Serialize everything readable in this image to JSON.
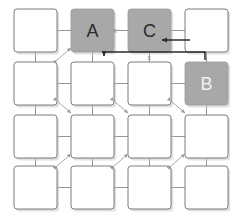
{
  "diagram": {
    "canvas": {
      "width": 237,
      "height": 218
    },
    "colors": {
      "background": "#ffffff",
      "node_fill": "#ffffff",
      "node_stroke": "#6e6e6e",
      "highlight_fill": "#a8a8a8",
      "highlight_stroke": "#9a9a9a",
      "connector": "#8a8a8a",
      "arrow": "#2b2b2b",
      "label_dark": "#2b2b2b",
      "label_light": "#f2f2f2",
      "x_mark": "#8d8d8d",
      "shadow": "#c9c9c9"
    },
    "grid": {
      "rows": 4,
      "cols": 4,
      "box_size": 43,
      "col_x": [
        14,
        71,
        128,
        185
      ],
      "row_y": [
        9,
        62,
        115,
        166
      ],
      "corner_radius": 3
    },
    "nodes": [
      {
        "id": "r0c0",
        "row": 0,
        "col": 0,
        "label": "",
        "state": "plain"
      },
      {
        "id": "r0c1",
        "row": 0,
        "col": 1,
        "label": "A",
        "state": "highlight",
        "label_color": "dark"
      },
      {
        "id": "r0c2",
        "row": 0,
        "col": 2,
        "label": "C",
        "state": "highlight",
        "label_color": "dark"
      },
      {
        "id": "r0c3",
        "row": 0,
        "col": 3,
        "label": "",
        "state": "plain"
      },
      {
        "id": "r1c0",
        "row": 1,
        "col": 0,
        "label": "",
        "state": "plain"
      },
      {
        "id": "r1c1",
        "row": 1,
        "col": 1,
        "label": "",
        "state": "plain"
      },
      {
        "id": "r1c2",
        "row": 1,
        "col": 2,
        "label": "",
        "state": "plain"
      },
      {
        "id": "r1c3",
        "row": 1,
        "col": 3,
        "label": "B",
        "state": "highlight",
        "label_color": "light"
      },
      {
        "id": "r2c0",
        "row": 2,
        "col": 0,
        "label": "",
        "state": "plain"
      },
      {
        "id": "r2c1",
        "row": 2,
        "col": 1,
        "label": "",
        "state": "plain"
      },
      {
        "id": "r2c2",
        "row": 2,
        "col": 2,
        "label": "",
        "state": "plain"
      },
      {
        "id": "r2c3",
        "row": 2,
        "col": 3,
        "label": "",
        "state": "plain"
      },
      {
        "id": "r3c0",
        "row": 3,
        "col": 0,
        "label": "",
        "state": "plain"
      },
      {
        "id": "r3c1",
        "row": 3,
        "col": 1,
        "label": "",
        "state": "plain"
      },
      {
        "id": "r3c2",
        "row": 3,
        "col": 2,
        "label": "",
        "state": "plain"
      },
      {
        "id": "r3c3",
        "row": 3,
        "col": 3,
        "label": "",
        "state": "plain"
      }
    ],
    "x_marks": [
      {
        "id": "x-between-a-and-c",
        "text": "x",
        "x": 115,
        "y": 30
      },
      {
        "id": "x-below-c",
        "text": "x",
        "x": 149,
        "y": 57
      }
    ],
    "diagonal_markers": [
      {
        "id": "diag-r0r1-c0c1",
        "x1": 57,
        "y1": 60,
        "x2": 71,
        "y2": 48,
        "direction": "up-right"
      },
      {
        "id": "diag-r1r2-c0c1",
        "x1": 57,
        "y1": 101,
        "x2": 71,
        "y2": 113,
        "direction": "down-right"
      },
      {
        "id": "diag-r1r2-c1c2",
        "x1": 114,
        "y1": 101,
        "x2": 128,
        "y2": 113,
        "direction": "down-right"
      },
      {
        "id": "diag-r1r2-c2c3",
        "x1": 171,
        "y1": 101,
        "x2": 185,
        "y2": 113,
        "direction": "down-right"
      },
      {
        "id": "diag-r2r3-c0c1",
        "x1": 57,
        "y1": 166,
        "x2": 71,
        "y2": 154,
        "direction": "up-right"
      },
      {
        "id": "diag-r2r3-c1c2",
        "x1": 114,
        "y1": 166,
        "x2": 128,
        "y2": 154,
        "direction": "up-right"
      },
      {
        "id": "diag-r2r3-c2c3",
        "x1": 171,
        "y1": 166,
        "x2": 185,
        "y2": 154,
        "direction": "up-right"
      }
    ],
    "routed_arrows": [
      {
        "id": "arrow-to-a",
        "from": "right side of grid row 1",
        "to": "A",
        "path": "M 205,60 L 205,52 L 104,52 L 104,56",
        "head_at": {
          "x": 104,
          "y": 52
        },
        "head_direction": "up"
      },
      {
        "id": "arrow-to-c",
        "from": "r0c3",
        "to": "C",
        "path": "M 190,40 L 162,40",
        "head_at": {
          "x": 162,
          "y": 40
        },
        "head_direction": "left"
      }
    ],
    "connector_segments": {
      "horizontal_between_cols": true,
      "vertical_between_rows": true
    }
  }
}
